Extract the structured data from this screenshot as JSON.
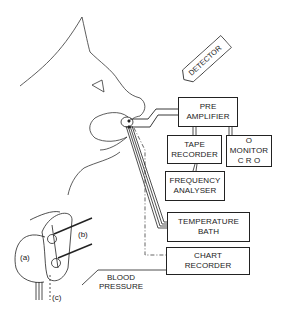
{
  "diagram": {
    "detector": "DETECTOR",
    "boxes": {
      "pre_amplifier": [
        "PRE",
        "AMPLIFIER"
      ],
      "tape_recorder": [
        "TAPE",
        "RECORDER"
      ],
      "monitor": [
        "O",
        "MONITOR",
        "C R O"
      ],
      "frequency_analyser": [
        "FREQUENCY",
        "ANALYSER"
      ],
      "temperature_bath": [
        "TEMPERATURE",
        "BATH"
      ],
      "chart_recorder": [
        "CHART",
        "RECORDER"
      ]
    },
    "labels": {
      "blood_pressure": [
        "BLOOD",
        "PRESSURE"
      ],
      "a": "(a)",
      "b": "(b)",
      "c": "(c)"
    },
    "colors": {
      "line": "#222222",
      "background": "#ffffff"
    }
  }
}
